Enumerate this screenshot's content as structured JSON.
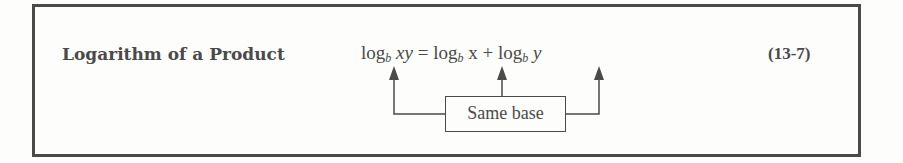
{
  "box": {
    "title": "Logarithm of a Product",
    "formula": {
      "lhs_log": "log",
      "lhs_base": "b",
      "lhs_arg": "xy",
      "equals": "=",
      "rhs1_log": "log",
      "rhs1_base": "b",
      "rhs1_arg": "x",
      "plus": "+",
      "rhs2_log": "log",
      "rhs2_base": "b",
      "rhs2_arg": "y"
    },
    "equation_number": "(13-7)",
    "annotation": "Same base"
  }
}
